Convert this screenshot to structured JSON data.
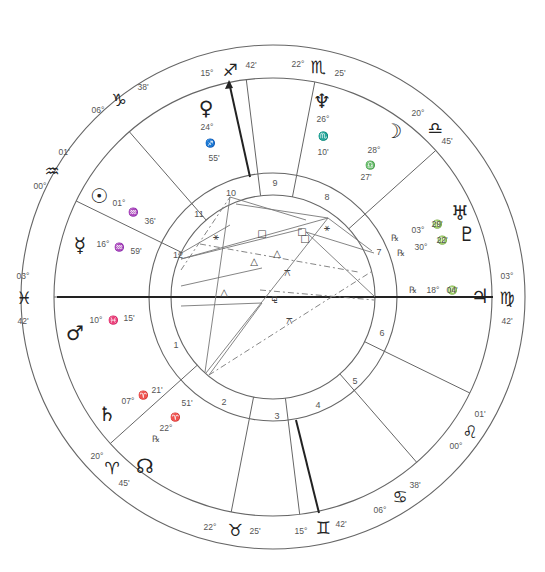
{
  "chart": {
    "center": [
      273,
      297
    ],
    "radii": {
      "outer": 252,
      "zodiac_inner": 219,
      "house_ring_outer": 124,
      "house_ring_inner": 102
    },
    "line_color": "#555555",
    "axis_color": "#222222"
  },
  "zodiac_cusps": [
    {
      "sign": "pisces",
      "glyph": "♓",
      "deg": "03°",
      "min": "42'",
      "x": 24,
      "y": 298,
      "dx": 23,
      "dy": 276,
      "mx": 23,
      "my": 321
    },
    {
      "sign": "aquarius",
      "glyph": "♒",
      "deg": "00°",
      "min": "01'",
      "x": 52,
      "y": 171,
      "dx": 40,
      "dy": 186,
      "mx": 64,
      "my": 152
    },
    {
      "sign": "capricorn",
      "glyph": "♑",
      "deg": "06°",
      "min": "38'",
      "x": 119,
      "y": 100,
      "dx": 98,
      "dy": 110,
      "mx": 143,
      "my": 87
    },
    {
      "sign": "sagittarius",
      "glyph": "♐",
      "deg": "15°",
      "min": "42'",
      "x": 230,
      "y": 70,
      "dx": 207,
      "dy": 73,
      "mx": 251,
      "my": 65
    },
    {
      "sign": "scorpio",
      "glyph": "♏",
      "deg": "22°",
      "min": "25'",
      "x": 318,
      "y": 67,
      "dx": 298,
      "dy": 64,
      "mx": 340,
      "my": 73
    },
    {
      "sign": "libra",
      "glyph": "♎",
      "deg": "20°",
      "min": "45'",
      "x": 435,
      "y": 128,
      "dx": 418,
      "dy": 113,
      "mx": 447,
      "my": 141
    },
    {
      "sign": "virgo",
      "glyph": "♍",
      "deg": "03°",
      "min": "42'",
      "x": 507,
      "y": 298,
      "dx": 507,
      "dy": 276,
      "mx": 507,
      "my": 321
    },
    {
      "sign": "leo",
      "glyph": "♌",
      "deg": "00°",
      "min": "01'",
      "x": 470,
      "y": 432,
      "dx": 456,
      "dy": 446,
      "mx": 480,
      "my": 414
    },
    {
      "sign": "cancer",
      "glyph": "♋",
      "deg": "06°",
      "min": "38'",
      "x": 400,
      "y": 497,
      "dx": 380,
      "dy": 510,
      "mx": 415,
      "my": 485
    },
    {
      "sign": "gemini",
      "glyph": "♊",
      "deg": "15°",
      "min": "42'",
      "x": 323,
      "y": 528,
      "dx": 301,
      "dy": 531,
      "mx": 341,
      "my": 524
    },
    {
      "sign": "taurus",
      "glyph": "♉",
      "deg": "22°",
      "min": "25'",
      "x": 235,
      "y": 530,
      "dx": 210,
      "dy": 527,
      "mx": 255,
      "my": 531
    },
    {
      "sign": "aries",
      "glyph": "♈",
      "deg": "20°",
      "min": "45'",
      "x": 112,
      "y": 468,
      "dx": 97,
      "dy": 456,
      "mx": 124,
      "my": 483
    }
  ],
  "houses": [
    {
      "num": "1",
      "x": 176,
      "y": 345
    },
    {
      "num": "2",
      "x": 224,
      "y": 402
    },
    {
      "num": "3",
      "x": 277,
      "y": 416
    },
    {
      "num": "4",
      "x": 318,
      "y": 405
    },
    {
      "num": "5",
      "x": 355,
      "y": 381
    },
    {
      "num": "6",
      "x": 382,
      "y": 333
    },
    {
      "num": "7",
      "x": 379,
      "y": 252
    },
    {
      "num": "8",
      "x": 327,
      "y": 197
    },
    {
      "num": "9",
      "x": 275,
      "y": 183
    },
    {
      "num": "10",
      "x": 231,
      "y": 193
    },
    {
      "num": "11",
      "x": 199,
      "y": 214
    },
    {
      "num": "12",
      "x": 178,
      "y": 255
    }
  ],
  "planets": [
    {
      "name": "venus",
      "glyph": "♀",
      "x": 206,
      "y": 108,
      "deg": "24°",
      "sign": "♐",
      "min": "55'",
      "lx": 207,
      "ly": 127,
      "lines": [
        [
          207,
          127
        ],
        [
          210,
          143
        ],
        [
          214,
          158
        ]
      ]
    },
    {
      "name": "neptune",
      "glyph": "♆",
      "x": 322,
      "y": 101,
      "deg": "26°",
      "sign": "♏",
      "min": "10'",
      "lx": 323,
      "ly": 119,
      "lines": [
        [
          323,
          119
        ],
        [
          323,
          136
        ],
        [
          323,
          152
        ]
      ]
    },
    {
      "name": "moon",
      "glyph": "☽",
      "x": 393,
      "y": 131,
      "deg": "28°",
      "sign": "♎",
      "min": "27'",
      "lines": [
        [
          374,
          150
        ],
        [
          370,
          165
        ],
        [
          366,
          177
        ]
      ]
    },
    {
      "name": "sun",
      "glyph": "☉",
      "x": 99,
      "y": 196,
      "deg": "01°",
      "sign": "♒",
      "min": "36'",
      "lines": [
        [
          119,
          203
        ],
        [
          133,
          212
        ],
        [
          150,
          221
        ]
      ]
    },
    {
      "name": "mercury",
      "glyph": "☿",
      "x": 80,
      "y": 245,
      "deg": "16°",
      "sign": "♒",
      "min": "59'",
      "lines": [
        [
          103,
          244
        ],
        [
          119,
          247
        ],
        [
          136,
          251
        ]
      ]
    },
    {
      "name": "mars",
      "glyph": "♂",
      "x": 75,
      "y": 333,
      "deg": "10°",
      "sign": "♓",
      "min": "15'",
      "lines": [
        [
          96,
          320
        ],
        [
          113,
          320
        ],
        [
          129,
          318
        ]
      ]
    },
    {
      "name": "uranus",
      "glyph": "♅",
      "x": 460,
      "y": 213,
      "deg": "03°",
      "sign": "♍",
      "min": "29'",
      "retro": "℞",
      "lines": [
        [
          395,
          238
        ],
        [
          418,
          230
        ],
        [
          437,
          224
        ]
      ]
    },
    {
      "name": "pluto",
      "glyph": "♇",
      "x": 467,
      "y": 234,
      "deg": "30°",
      "sign": "♍",
      "min": "22'",
      "retro": "℞",
      "lines": [
        [
          401,
          253
        ],
        [
          421,
          247
        ],
        [
          442,
          240
        ]
      ]
    },
    {
      "name": "jupiter",
      "glyph": "♃",
      "x": 480,
      "y": 296,
      "deg": "18°",
      "sign": "♍",
      "min": "04'",
      "retro": "℞",
      "lines": [
        [
          413,
          290
        ],
        [
          433,
          290
        ],
        [
          452,
          290
        ]
      ]
    },
    {
      "name": "saturn",
      "glyph": "♄",
      "x": 107,
      "y": 414,
      "deg": "07°",
      "sign": "♈",
      "min": "21'",
      "lines": [
        [
          128,
          401
        ],
        [
          143,
          395
        ],
        [
          157,
          390
        ]
      ]
    },
    {
      "name": "north-node",
      "glyph": "☊",
      "x": 145,
      "y": 466,
      "deg": "22°",
      "sign": "♈",
      "min": "51'",
      "retro": "℞",
      "lines": [
        [
          156,
          439
        ],
        [
          166,
          428
        ],
        [
          175,
          417
        ],
        [
          187,
          403
        ]
      ]
    }
  ],
  "aspect_symbols": [
    {
      "glyph": "□",
      "x": 262,
      "y": 233
    },
    {
      "glyph": "□",
      "x": 302,
      "y": 231
    },
    {
      "glyph": "□",
      "x": 305,
      "y": 238
    },
    {
      "glyph": "⚹",
      "x": 216,
      "y": 236
    },
    {
      "glyph": "⚹",
      "x": 327,
      "y": 227
    },
    {
      "glyph": "△",
      "x": 277,
      "y": 253
    },
    {
      "glyph": "△",
      "x": 254,
      "y": 261
    },
    {
      "glyph": "△",
      "x": 224,
      "y": 292
    },
    {
      "glyph": "⚼",
      "x": 274,
      "y": 297
    },
    {
      "glyph": "⚻",
      "x": 287,
      "y": 272
    },
    {
      "glyph": "⚻",
      "x": 289,
      "y": 320
    }
  ]
}
